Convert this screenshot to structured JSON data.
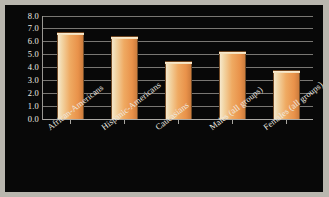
{
  "chart_data": {
    "type": "bar",
    "title": "",
    "subtitle": "",
    "xlabel": "",
    "ylabel": "",
    "categories": [
      "African-Americans",
      "Hispanic-Americans",
      "Caucasians",
      "Males (all groups)",
      "Females (all groups)"
    ],
    "values": [
      6.75,
      6.45,
      4.5,
      5.3,
      3.8
    ],
    "ylim": [
      0.0,
      8.0
    ],
    "ytick_labels": [
      "8.0",
      "7.0",
      "6.0",
      "5.0",
      "4.0",
      "3.0",
      "2.0",
      "1.0",
      "0.0"
    ],
    "ytick_values": [
      8.0,
      7.0,
      6.0,
      5.0,
      4.0,
      3.0,
      2.0,
      1.0,
      0.0
    ],
    "grid": true,
    "legend": null,
    "legend_position": "none",
    "annotations": []
  },
  "style": {
    "background_color": "#080808",
    "frame_color": "#b9b6ae",
    "bar_color": "#efaa62",
    "bar_highlight_color": "#f6e7cb",
    "bar_edge_color": "#6d4420",
    "grid_color": "#8d8b86",
    "axis_color": "#c9c7c1",
    "text_color": "#efece4"
  }
}
